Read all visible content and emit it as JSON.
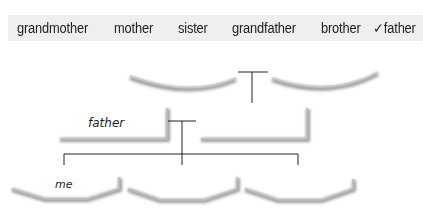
{
  "word_bank": {
    "words": [
      {
        "text": "grandmother",
        "checked": false
      },
      {
        "text": "mother",
        "checked": false
      },
      {
        "text": "sister",
        "checked": false
      },
      {
        "text": "grandfather",
        "checked": false
      },
      {
        "text": "brother",
        "checked": false
      },
      {
        "text": "father",
        "checked": true
      }
    ],
    "check_mark": "✓"
  },
  "tree": {
    "grandparents": [
      {
        "slot": "grandparent-left",
        "label": ""
      },
      {
        "slot": "grandparent-right",
        "label": ""
      }
    ],
    "parents": [
      {
        "slot": "parent-left",
        "label": "father"
      },
      {
        "slot": "parent-right",
        "label": ""
      }
    ],
    "children": [
      {
        "slot": "child-1",
        "label": "me"
      },
      {
        "slot": "child-2",
        "label": ""
      },
      {
        "slot": "child-3",
        "label": ""
      }
    ]
  }
}
